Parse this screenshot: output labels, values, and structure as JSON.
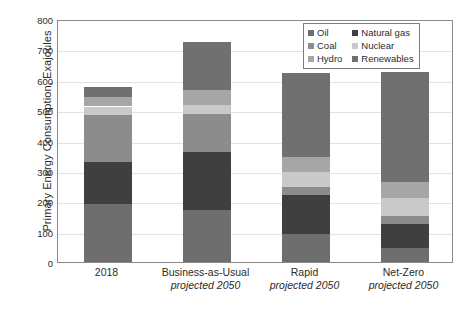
{
  "chart_data": {
    "type": "bar",
    "stacked": true,
    "title": "",
    "xlabel": "",
    "ylabel": "Primary Energy Consumption, Exajoules",
    "ylim": [
      0,
      800
    ],
    "ytick_values": [
      0,
      100,
      200,
      300,
      400,
      500,
      600,
      700,
      800
    ],
    "ytick_labels": [
      "0",
      "100",
      "200",
      "300",
      "400",
      "500",
      "600",
      "700",
      "800"
    ],
    "grid": true,
    "legend_position": "top-right",
    "categories": [
      "2018",
      "Business-as-Usual",
      "Rapid",
      "Net-Zero"
    ],
    "category_sublabels": [
      "",
      "projected 2050",
      "projected 2050",
      "projected 2050"
    ],
    "series": [
      {
        "name": "Oil",
        "color": "#6e6e6e",
        "values": [
          190,
          170,
          92,
          45
        ]
      },
      {
        "name": "Natural gas",
        "color": "#3f3f3f",
        "values": [
          138,
          192,
          130,
          80
        ]
      },
      {
        "name": "Coal",
        "color": "#8c8c8c",
        "values": [
          157,
          126,
          25,
          25
        ]
      },
      {
        "name": "Nuclear",
        "color": "#c9c9c9",
        "values": [
          27,
          30,
          48,
          60
        ]
      },
      {
        "name": "Hydro",
        "color": "#a6a6a6",
        "values": [
          30,
          47,
          50,
          55
        ]
      },
      {
        "name": "Renewables",
        "color": "#707070",
        "values": [
          33,
          160,
          278,
          360
        ]
      }
    ],
    "totals": [
      575,
      725,
      623,
      625
    ]
  },
  "legend": {
    "entries": [
      {
        "label": "Oil",
        "swatch": "#6e6e6e"
      },
      {
        "label": "Natural gas",
        "swatch": "#3f3f3f"
      },
      {
        "label": "Coal",
        "swatch": "#8c8c8c"
      },
      {
        "label": "Nuclear",
        "swatch": "#c9c9c9"
      },
      {
        "label": "Hydro",
        "swatch": "#a6a6a6"
      },
      {
        "label": "Renewables",
        "swatch": "#707070"
      }
    ]
  },
  "colors": {
    "axis": "#8a8a8a",
    "grid": "#e2e2e2",
    "text": "#2b2b2b",
    "background": "#ffffff"
  }
}
